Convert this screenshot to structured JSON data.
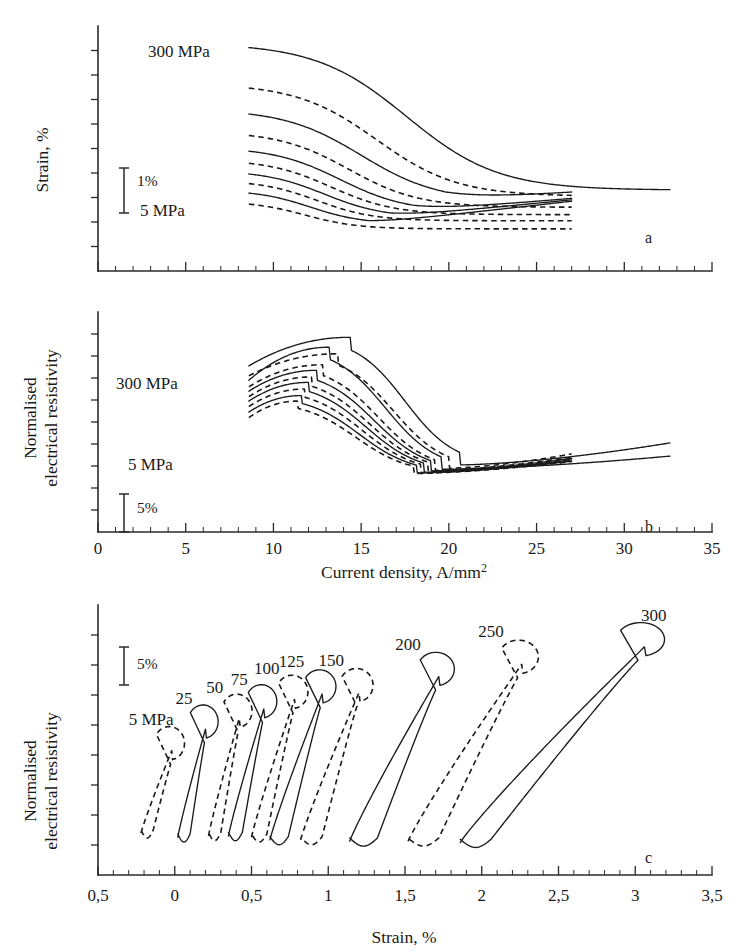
{
  "figure": {
    "panels": [
      "a",
      "b",
      "c"
    ],
    "background": "#ffffff",
    "ink": "#1a1a1a"
  },
  "panel_a": {
    "letter": "a",
    "ylabel": "Strain, %",
    "scalebar_label": "1%",
    "annotations": [
      {
        "text": "300 MPa",
        "x": 0.22,
        "y": 0.93
      },
      {
        "text": "5 MPa",
        "x": 0.22,
        "y": 0.22
      }
    ]
  },
  "panel_b": {
    "letter": "b",
    "ylabel_line1": "Normalised",
    "ylabel_line2": "electrical resistivity",
    "scalebar_label": "5%",
    "xlabel": "Current density, A/mm²",
    "annotations": [
      {
        "text": "300 MPa",
        "x": 0.2,
        "y": 0.78
      },
      {
        "text": "5 MPa",
        "x": 0.23,
        "y": 0.49
      }
    ]
  },
  "panel_c": {
    "letter": "c",
    "ylabel_line1": "Normalised",
    "ylabel_line2": "electrical resistivity",
    "scalebar_label": "5%",
    "xlabel": "Strain, %",
    "curve_labels": [
      "5 MPa",
      "25",
      "50",
      "75",
      "100",
      "125",
      "150",
      "200",
      "250",
      "300"
    ]
  },
  "chart_data": [
    {
      "id": "a",
      "type": "line",
      "title": "",
      "xlabel": "Current density, A/mm²",
      "ylabel": "Strain, %",
      "xlim": [
        0,
        35
      ],
      "ylim": [
        0,
        10
      ],
      "xticks": [
        0,
        5,
        10,
        15,
        20,
        25,
        30,
        35
      ],
      "xtick_labels": [
        "",
        "",
        "",
        "",
        "",
        "",
        "",
        ""
      ],
      "minor_tick_step": 1,
      "grid": false,
      "legend": "none",
      "scale_bar": {
        "label": "1%",
        "value": 1,
        "units": "%"
      },
      "annotations": [
        {
          "text": "300 MPa",
          "meaning": "topmost curve pre-stress"
        },
        {
          "text": "5 MPa",
          "meaning": "lowest curve pre-stress"
        }
      ],
      "note": "Ten sigmoid (falling S-shape) strain-vs-current-density curves, alternating solid and dashed linestyles, one for each applied pre-stress level. Higher pre-stress curves start higher and transition at higher current density.",
      "series": [
        {
          "name": "300 MPa",
          "style": "solid",
          "plateau_start": 9.3,
          "plateau_end": 3.3,
          "x_mid": 17.6,
          "width": 2.6,
          "x_start": 8.6,
          "x_end": 32.6,
          "tail_rise": 0.0
        },
        {
          "name": "250 MPa",
          "style": "dashed",
          "plateau_start": 7.65,
          "plateau_end": 3.05,
          "x_mid": 15.9,
          "width": 2.3,
          "x_start": 8.6,
          "x_end": 27.0,
          "tail_rise": 0.0
        },
        {
          "name": "200 MPa",
          "style": "solid",
          "plateau_start": 6.6,
          "plateau_end": 2.85,
          "x_mid": 15.0,
          "width": 2.2,
          "x_start": 8.6,
          "x_end": 27.0,
          "tail_rise": 0.05
        },
        {
          "name": "150 MPa",
          "style": "dashed",
          "plateau_start": 5.7,
          "plateau_end": 2.6,
          "x_mid": 14.3,
          "width": 2.0,
          "x_start": 8.6,
          "x_end": 27.0,
          "tail_rise": 0.0
        },
        {
          "name": "125 MPa",
          "style": "solid",
          "plateau_start": 5.05,
          "plateau_end": 2.42,
          "x_mid": 13.8,
          "width": 1.9,
          "x_start": 8.6,
          "x_end": 27.0,
          "tail_rise": 0.06
        },
        {
          "name": "100 MPa",
          "style": "dashed",
          "plateau_start": 4.55,
          "plateau_end": 2.3,
          "x_mid": 13.3,
          "width": 1.8,
          "x_start": 8.6,
          "x_end": 27.0,
          "tail_rise": 0.0
        },
        {
          "name": "75 MPa",
          "style": "solid",
          "plateau_start": 4.1,
          "plateau_end": 2.18,
          "x_mid": 12.9,
          "width": 1.7,
          "x_start": 8.6,
          "x_end": 27.0,
          "tail_rise": 0.07
        },
        {
          "name": "50 MPa",
          "style": "dashed",
          "plateau_start": 3.7,
          "plateau_end": 2.05,
          "x_mid": 12.5,
          "width": 1.6,
          "x_start": 8.6,
          "x_end": 27.0,
          "tail_rise": 0.0
        },
        {
          "name": "25 MPa",
          "style": "solid",
          "plateau_start": 3.3,
          "plateau_end": 1.92,
          "x_mid": 12.1,
          "width": 1.5,
          "x_start": 8.6,
          "x_end": 27.0,
          "tail_rise": 0.08
        },
        {
          "name": "5 MPa",
          "style": "dashed",
          "plateau_start": 2.85,
          "plateau_end": 1.72,
          "x_mid": 11.8,
          "width": 1.5,
          "x_start": 8.6,
          "x_end": 27.0,
          "tail_rise": 0.0
        }
      ]
    },
    {
      "id": "b",
      "type": "line",
      "title": "",
      "xlabel": "Current density, A/mm²",
      "ylabel": "Normalised electrical resistivity",
      "xlim": [
        0,
        35
      ],
      "ylim": [
        0,
        10
      ],
      "xticks": [
        0,
        5,
        10,
        15,
        20,
        25,
        30,
        35
      ],
      "xtick_labels": [
        "0",
        "5",
        "10",
        "15",
        "20",
        "25",
        "30",
        "35"
      ],
      "minor_tick_step": 1,
      "grid": false,
      "legend": "none",
      "scale_bar": {
        "label": "5%",
        "value": 5,
        "units": "%"
      },
      "annotations": [
        {
          "text": "300 MPa",
          "meaning": "uppermost family member"
        },
        {
          "text": "5 MPa",
          "meaning": "lowest family member"
        }
      ],
      "note": "Ten normalised-resistivity curves that rise to a rounded peak near 13-15 A/mm² then drop steeply to a common minimum near 19-21 A/mm² and rise slowly afterwards. Alternating solid and dashed linestyles.",
      "series": [
        {
          "name": "300 MPa",
          "style": "solid",
          "y_start": 7.55,
          "y_peak": 8.85,
          "x_peak": 14.4,
          "y_min": 3.05,
          "x_min": 20.6,
          "y_end": 4.05,
          "x_start": 8.6,
          "x_end": 32.6
        },
        {
          "name": "250 MPa",
          "style": "dashed",
          "y_start": 7.1,
          "y_peak": 8.1,
          "x_peak": 13.7,
          "y_min": 2.9,
          "x_min": 20.0,
          "y_end": 3.55,
          "x_start": 8.6,
          "x_end": 27.0
        },
        {
          "name": "200 MPa",
          "style": "solid",
          "y_start": 6.9,
          "y_peak": 8.4,
          "x_peak": 13.2,
          "y_min": 2.85,
          "x_min": 19.6,
          "y_end": 3.45,
          "x_start": 8.6,
          "x_end": 32.6
        },
        {
          "name": "150 MPa",
          "style": "dashed",
          "y_start": 6.6,
          "y_peak": 7.6,
          "x_peak": 12.8,
          "y_min": 2.8,
          "x_min": 19.2,
          "y_end": 3.4,
          "x_start": 8.6,
          "x_end": 27.0
        },
        {
          "name": "125 MPa",
          "style": "solid",
          "y_start": 6.4,
          "y_peak": 7.35,
          "x_peak": 12.5,
          "y_min": 2.78,
          "x_min": 19.0,
          "y_end": 3.35,
          "x_start": 8.6,
          "x_end": 27.0
        },
        {
          "name": "100 MPa",
          "style": "dashed",
          "y_start": 6.15,
          "y_peak": 7.05,
          "x_peak": 12.2,
          "y_min": 2.75,
          "x_min": 18.8,
          "y_end": 3.3,
          "x_start": 8.6,
          "x_end": 27.0
        },
        {
          "name": "75 MPa",
          "style": "solid",
          "y_start": 5.95,
          "y_peak": 6.8,
          "x_peak": 12.0,
          "y_min": 2.72,
          "x_min": 18.6,
          "y_end": 3.28,
          "x_start": 8.6,
          "x_end": 27.0
        },
        {
          "name": "50 MPa",
          "style": "dashed",
          "y_start": 5.7,
          "y_peak": 6.5,
          "x_peak": 11.8,
          "y_min": 2.7,
          "x_min": 18.4,
          "y_end": 3.25,
          "x_start": 8.6,
          "x_end": 27.0
        },
        {
          "name": "25 MPa",
          "style": "solid",
          "y_start": 5.45,
          "y_peak": 6.2,
          "x_peak": 11.6,
          "y_min": 2.68,
          "x_min": 18.2,
          "y_end": 3.22,
          "x_start": 8.6,
          "x_end": 27.0
        },
        {
          "name": "5 MPa",
          "style": "dashed",
          "y_start": 5.2,
          "y_peak": 5.95,
          "x_peak": 11.4,
          "y_min": 2.66,
          "x_min": 18.0,
          "y_end": 3.2,
          "x_start": 8.6,
          "x_end": 27.0
        }
      ]
    },
    {
      "id": "c",
      "type": "line",
      "title": "",
      "xlabel": "Strain, %",
      "ylabel": "Normalised electrical resistivity",
      "xlim": [
        -0.5,
        3.5
      ],
      "ylim": [
        0,
        10
      ],
      "xticks": [
        -0.5,
        0,
        0.5,
        1,
        1.5,
        2,
        2.5,
        3,
        3.5
      ],
      "xtick_labels": [
        "0,5",
        "0",
        "0,5",
        "1",
        "1,5",
        "2",
        "2,5",
        "3",
        "3,5"
      ],
      "minor_tick_step": 0.1,
      "grid": false,
      "legend": "none",
      "scale_bar": {
        "label": "5%",
        "value": 5,
        "units": "%"
      },
      "note": "Ten narrow hysteresis loops of normalised electrical resistivity against strain, one per pre-stress level. Each loop rises steeply from a low-strain foot, hooks over at the top and returns down the inside. Loops shift progressively to the right and grow taller with increasing pre-stress. Solid and dashed line styles alternate.",
      "loops": [
        {
          "label": "5 MPa",
          "style": "dashed",
          "x_foot": -0.22,
          "x_top": -0.02,
          "y_foot": 1.55,
          "y_top": 5.15,
          "return_x": -0.14,
          "label_x": -0.3,
          "label_y": 5.55
        },
        {
          "label": "25",
          "style": "solid",
          "x_foot": 0.02,
          "x_top": 0.2,
          "y_foot": 1.4,
          "y_top": 5.95,
          "return_x": 0.1,
          "label_x": 0.06,
          "label_y": 6.35
        },
        {
          "label": "50",
          "style": "dashed",
          "x_foot": 0.22,
          "x_top": 0.42,
          "y_foot": 1.45,
          "y_top": 6.35,
          "return_x": 0.3,
          "label_x": 0.26,
          "label_y": 6.75
        },
        {
          "label": "75",
          "style": "solid",
          "x_foot": 0.35,
          "x_top": 0.58,
          "y_foot": 1.45,
          "y_top": 6.7,
          "return_x": 0.44,
          "label_x": 0.42,
          "label_y": 7.05
        },
        {
          "label": "100",
          "style": "dashed",
          "x_foot": 0.5,
          "x_top": 0.78,
          "y_foot": 1.4,
          "y_top": 7.05,
          "return_x": 0.6,
          "label_x": 0.6,
          "label_y": 7.45
        },
        {
          "label": "125",
          "style": "solid",
          "x_foot": 0.62,
          "x_top": 0.96,
          "y_foot": 1.3,
          "y_top": 7.25,
          "return_x": 0.74,
          "label_x": 0.76,
          "label_y": 7.7
        },
        {
          "label": "150",
          "style": "dashed",
          "x_foot": 0.82,
          "x_top": 1.2,
          "y_foot": 1.3,
          "y_top": 7.3,
          "return_x": 0.96,
          "label_x": 1.02,
          "label_y": 7.75
        },
        {
          "label": "200",
          "style": "solid",
          "x_foot": 1.14,
          "x_top": 1.72,
          "y_foot": 1.25,
          "y_top": 7.9,
          "return_x": 1.32,
          "label_x": 1.52,
          "label_y": 8.35
        },
        {
          "label": "250",
          "style": "dashed",
          "x_foot": 1.52,
          "x_top": 2.26,
          "y_foot": 1.25,
          "y_top": 8.35,
          "return_x": 1.72,
          "label_x": 2.06,
          "label_y": 8.8
        },
        {
          "label": "300",
          "style": "solid",
          "x_foot": 1.86,
          "x_top": 3.06,
          "y_foot": 1.2,
          "y_top": 9.0,
          "return_x": 2.06,
          "label_x": 3.12,
          "label_y": 9.4
        }
      ]
    }
  ]
}
